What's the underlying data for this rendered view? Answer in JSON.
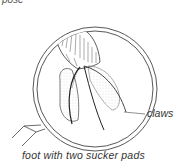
{
  "figure": {
    "top_text_fragment": "pose",
    "caption": "foot with two sucker pads",
    "labels": {
      "claws": "claws"
    },
    "colors": {
      "line": "#333333",
      "stipple": "#777777",
      "background": "#ffffff"
    }
  }
}
